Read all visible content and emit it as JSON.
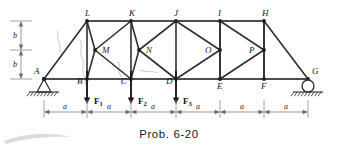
{
  "figure": {
    "caption": "Prob. 6-20",
    "type": "truss-free-body-diagram",
    "colors": {
      "member": "#2b2b2b",
      "chord": "#4a4a4a",
      "dimension": "#6b6b6b",
      "artifact": "#cfcfcf",
      "label": "#1a1a1a"
    }
  },
  "nodes": [
    {
      "id": "A",
      "label": "A",
      "x": 44,
      "y": 79,
      "label_dx": -10,
      "label_dy": -12,
      "role": "pin-support"
    },
    {
      "id": "B",
      "label": "B",
      "x": 87,
      "y": 79,
      "label_dx": -10,
      "label_dy": -2,
      "role": "loaded-joint"
    },
    {
      "id": "C",
      "label": "C",
      "x": 131,
      "y": 79,
      "label_dx": -10,
      "label_dy": -2,
      "role": "loaded-joint"
    },
    {
      "id": "D",
      "label": "D",
      "x": 176,
      "y": 79,
      "label_dx": -10,
      "label_dy": -2,
      "role": "loaded-joint"
    },
    {
      "id": "E",
      "label": "E",
      "x": 220,
      "y": 79,
      "label_dx": -3,
      "label_dy": 3,
      "role": "joint"
    },
    {
      "id": "F",
      "label": "F",
      "x": 264,
      "y": 79,
      "label_dx": -3,
      "label_dy": 3,
      "role": "joint"
    },
    {
      "id": "G",
      "label": "G",
      "x": 308,
      "y": 79,
      "label_dx": 4,
      "label_dy": -12,
      "role": "roller-support"
    },
    {
      "id": "L",
      "label": "L",
      "x": 87,
      "y": 21,
      "label_dx": -2,
      "label_dy": -12,
      "role": "joint"
    },
    {
      "id": "K",
      "label": "K",
      "x": 131,
      "y": 21,
      "label_dx": -2,
      "label_dy": -12,
      "role": "joint"
    },
    {
      "id": "J",
      "label": "J",
      "x": 176,
      "y": 21,
      "label_dx": -2,
      "label_dy": -12,
      "role": "joint"
    },
    {
      "id": "I",
      "label": "I",
      "x": 220,
      "y": 21,
      "label_dx": -2,
      "label_dy": -12,
      "role": "joint"
    },
    {
      "id": "H",
      "label": "H",
      "x": 264,
      "y": 21,
      "label_dx": -2,
      "label_dy": -12,
      "role": "joint"
    },
    {
      "id": "M",
      "label": "M",
      "x": 95,
      "y": 50,
      "label_dx": 7,
      "label_dy": -4,
      "role": "joint"
    },
    {
      "id": "N",
      "label": "N",
      "x": 139,
      "y": 50,
      "label_dx": 7,
      "label_dy": -4,
      "role": "joint"
    },
    {
      "id": "O",
      "label": "O",
      "x": 220,
      "y": 50,
      "label_dx": -15,
      "label_dy": -4,
      "role": "joint"
    },
    {
      "id": "P",
      "label": "P",
      "x": 264,
      "y": 50,
      "label_dx": -15,
      "label_dy": -4,
      "role": "joint"
    }
  ],
  "members": [
    {
      "from": "A",
      "to": "B",
      "kind": "chord"
    },
    {
      "from": "B",
      "to": "C",
      "kind": "chord"
    },
    {
      "from": "C",
      "to": "D",
      "kind": "chord"
    },
    {
      "from": "D",
      "to": "E",
      "kind": "chord"
    },
    {
      "from": "E",
      "to": "F",
      "kind": "chord"
    },
    {
      "from": "F",
      "to": "G",
      "kind": "chord"
    },
    {
      "from": "L",
      "to": "K",
      "kind": "chord"
    },
    {
      "from": "K",
      "to": "J",
      "kind": "chord"
    },
    {
      "from": "J",
      "to": "I",
      "kind": "chord"
    },
    {
      "from": "I",
      "to": "H",
      "kind": "chord"
    },
    {
      "from": "A",
      "to": "L",
      "kind": "web"
    },
    {
      "from": "H",
      "to": "G",
      "kind": "web"
    },
    {
      "from": "L",
      "to": "B",
      "kind": "web"
    },
    {
      "from": "K",
      "to": "C",
      "kind": "web"
    },
    {
      "from": "J",
      "to": "D",
      "kind": "web"
    },
    {
      "from": "I",
      "to": "E",
      "kind": "web"
    },
    {
      "from": "H",
      "to": "F",
      "kind": "web"
    },
    {
      "from": "M",
      "to": "L",
      "kind": "web"
    },
    {
      "from": "M",
      "to": "B",
      "kind": "web"
    },
    {
      "from": "M",
      "to": "K",
      "kind": "web"
    },
    {
      "from": "M",
      "to": "C",
      "kind": "web"
    },
    {
      "from": "N",
      "to": "K",
      "kind": "web"
    },
    {
      "from": "N",
      "to": "C",
      "kind": "web"
    },
    {
      "from": "N",
      "to": "J",
      "kind": "web"
    },
    {
      "from": "N",
      "to": "D",
      "kind": "web"
    },
    {
      "from": "O",
      "to": "J",
      "kind": "web"
    },
    {
      "from": "O",
      "to": "D",
      "kind": "web"
    },
    {
      "from": "O",
      "to": "I",
      "kind": "web"
    },
    {
      "from": "O",
      "to": "E",
      "kind": "web"
    },
    {
      "from": "P",
      "to": "I",
      "kind": "web"
    },
    {
      "from": "P",
      "to": "E",
      "kind": "web"
    },
    {
      "from": "P",
      "to": "H",
      "kind": "web"
    },
    {
      "from": "P",
      "to": "F",
      "kind": "web"
    }
  ],
  "loads": [
    {
      "id": "F1",
      "label": "F",
      "sub": "1",
      "at": "B",
      "x": 87,
      "tip_y": 104,
      "label_x": 94,
      "label_y": 97,
      "direction": "down"
    },
    {
      "id": "F2",
      "label": "F",
      "sub": "2",
      "at": "C",
      "x": 131,
      "tip_y": 104,
      "label_x": 138,
      "label_y": 97,
      "direction": "down"
    },
    {
      "id": "F3",
      "label": "F",
      "sub": "3",
      "at": "D",
      "x": 176,
      "tip_y": 104,
      "label_x": 183,
      "label_y": 97,
      "direction": "down"
    }
  ],
  "dimensions": {
    "horizontal": {
      "label": "a",
      "count": 6,
      "y": 112,
      "ticks": [
        44,
        87,
        131,
        176,
        220,
        264,
        308
      ],
      "labels": [
        {
          "text": "a",
          "x": 65
        },
        {
          "text": "a",
          "x": 109
        },
        {
          "text": "a",
          "x": 153
        },
        {
          "text": "a",
          "x": 198
        },
        {
          "text": "a",
          "x": 242
        },
        {
          "text": "a",
          "x": 286
        }
      ]
    },
    "vertical": {
      "label": "b",
      "count": 2,
      "x": 21,
      "ticks": [
        21,
        50,
        79
      ],
      "labels": [
        {
          "text": "b",
          "y": 36
        },
        {
          "text": "b",
          "y": 65
        }
      ]
    }
  },
  "supports": {
    "pin": {
      "node": "A",
      "x": 44,
      "y": 79,
      "ground_y": 92,
      "hatch_half_width": 15
    },
    "roller": {
      "node": "G",
      "x": 308,
      "y": 79,
      "radius": 6,
      "ground_y": 92,
      "hatch_half_width": 15
    }
  }
}
